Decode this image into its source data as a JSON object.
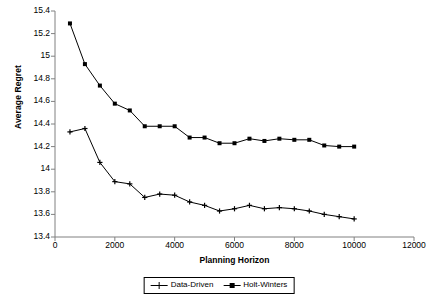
{
  "chart_data": {
    "type": "line",
    "title": "",
    "xlabel": "Planning Horizon",
    "ylabel": "Average Regret",
    "xlim": [
      0,
      12000
    ],
    "ylim": [
      13.4,
      15.4
    ],
    "xticks": [
      0,
      2000,
      4000,
      6000,
      8000,
      10000,
      12000
    ],
    "xtick_labels": [
      "0",
      "2000",
      "4000",
      "6000",
      "8000",
      "10000",
      "12000"
    ],
    "yticks": [
      13.4,
      13.6,
      13.8,
      14,
      14.2,
      14.4,
      14.6,
      14.8,
      15,
      15.2,
      15.4
    ],
    "ytick_labels": [
      "13.4",
      "13.6",
      "13.8",
      "14",
      "14.2",
      "14.4",
      "14.6",
      "14.8",
      "15",
      "15.2",
      "15.4"
    ],
    "grid": false,
    "legend_position": "bottom",
    "x": [
      500,
      1000,
      1500,
      2000,
      2500,
      3000,
      3500,
      4000,
      4500,
      5000,
      5500,
      6000,
      6500,
      7000,
      7500,
      8000,
      8500,
      9000,
      9500,
      10000
    ],
    "series": [
      {
        "name": "Data-Driven",
        "marker": "cross",
        "color": "#000000",
        "values": [
          14.33,
          14.36,
          14.06,
          13.89,
          13.87,
          13.75,
          13.78,
          13.77,
          13.71,
          13.68,
          13.63,
          13.65,
          13.68,
          13.65,
          13.66,
          13.65,
          13.63,
          13.6,
          13.58,
          13.56
        ]
      },
      {
        "name": "Holt-Winters",
        "marker": "square",
        "color": "#000000",
        "values": [
          15.29,
          14.93,
          14.74,
          14.58,
          14.52,
          14.38,
          14.38,
          14.38,
          14.28,
          14.28,
          14.23,
          14.23,
          14.27,
          14.25,
          14.27,
          14.26,
          14.26,
          14.21,
          14.2,
          14.2
        ]
      }
    ]
  },
  "legend": {
    "items": [
      {
        "label": "Data-Driven"
      },
      {
        "label": "Holt-Winters"
      }
    ]
  }
}
